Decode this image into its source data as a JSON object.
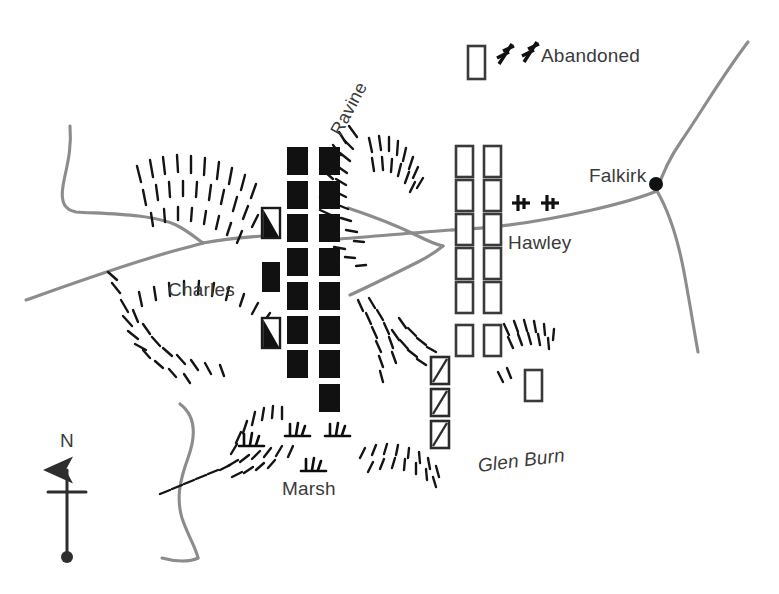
{
  "map": {
    "title": "Battle of Falkirk Muir schematic map",
    "canvas": {
      "width": 779,
      "height": 594
    },
    "colors": {
      "background": "#ffffff",
      "text": "#3b3b3b",
      "road": "#8c8c8c",
      "unit_fill_jacobite": "#111111",
      "unit_outline_government": "#3a3a3a",
      "hachure": "#1a1a1a"
    }
  },
  "labels": {
    "falkirk": "Falkirk",
    "hawley": "Hawley",
    "charles": "Charles",
    "abandoned": "Abandoned",
    "marsh": "Marsh",
    "glen_burn": "Glen Burn",
    "ravine": "Ravine",
    "north": "N"
  },
  "legend_semantics": {
    "solid_black_block": "Jacobite (Charles) infantry regiment",
    "hollow_block": "Government (Hawley) infantry regiment",
    "half_black_block": "Jacobite unit partially engaged",
    "diagonal_slash_block": "Government unit routed / withdrawing",
    "cannon_symbol": "artillery battery",
    "marsh_tuft": "marsh ground",
    "hachure": "steep slope / ravine edge"
  },
  "forces": {
    "jacobite_columns": [
      {
        "name": "jacobite-left-detached",
        "x": 262,
        "blocks": [
          {
            "y": 208,
            "style": "half"
          },
          {
            "y": 262,
            "style": "solid"
          },
          {
            "y": 318,
            "style": "half"
          }
        ]
      },
      {
        "name": "jacobite-front-line",
        "x": 287,
        "blocks": [
          {
            "y": 147,
            "style": "solid"
          },
          {
            "y": 181,
            "style": "solid"
          },
          {
            "y": 214,
            "style": "solid"
          },
          {
            "y": 248,
            "style": "solid"
          },
          {
            "y": 282,
            "style": "solid"
          },
          {
            "y": 316,
            "style": "solid"
          },
          {
            "y": 350,
            "style": "solid"
          }
        ]
      },
      {
        "name": "jacobite-second-line",
        "x": 319,
        "blocks": [
          {
            "y": 147,
            "style": "solid"
          },
          {
            "y": 181,
            "style": "solid"
          },
          {
            "y": 214,
            "style": "solid"
          },
          {
            "y": 248,
            "style": "solid"
          },
          {
            "y": 282,
            "style": "solid"
          },
          {
            "y": 316,
            "style": "solid"
          },
          {
            "y": 350,
            "style": "solid"
          },
          {
            "y": 384,
            "style": "solid"
          }
        ]
      }
    ],
    "government_columns": [
      {
        "name": "government-front-line",
        "x": 456,
        "blocks": [
          {
            "y": 146,
            "style": "hollow"
          },
          {
            "y": 180,
            "style": "hollow"
          },
          {
            "y": 214,
            "style": "hollow"
          },
          {
            "y": 248,
            "style": "hollow"
          },
          {
            "y": 282,
            "style": "hollow"
          },
          {
            "y": 325,
            "style": "hollow"
          }
        ]
      },
      {
        "name": "government-second-line",
        "x": 483,
        "blocks": [
          {
            "y": 146,
            "style": "hollow"
          },
          {
            "y": 180,
            "style": "hollow"
          },
          {
            "y": 214,
            "style": "hollow"
          },
          {
            "y": 248,
            "style": "hollow"
          },
          {
            "y": 282,
            "style": "hollow"
          },
          {
            "y": 325,
            "style": "hollow"
          }
        ]
      },
      {
        "name": "government-routed-column",
        "x": 431,
        "blocks": [
          {
            "y": 357,
            "style": "slash"
          },
          {
            "y": 387,
            "style": "slash"
          },
          {
            "y": 417,
            "style": "slash"
          }
        ]
      },
      {
        "name": "government-reserve",
        "x": 525,
        "blocks": [
          {
            "y": 370,
            "style": "hollow"
          }
        ]
      },
      {
        "name": "government-abandoned-unit",
        "x": 468,
        "blocks": [
          {
            "y": 46,
            "style": "hollow"
          }
        ]
      }
    ],
    "artillery": [
      {
        "name": "abandoned-guns",
        "x": 499,
        "y": 52,
        "count": 2,
        "style": "diagonal"
      },
      {
        "name": "hawley-guns",
        "x": 516,
        "y": 198,
        "count": 2,
        "style": "upright"
      }
    ]
  }
}
